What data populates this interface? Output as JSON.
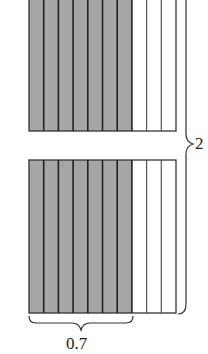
{
  "diagram": {
    "type": "fraction-model",
    "rectangles": [
      {
        "name": "top",
        "columns": 10,
        "shaded": 7,
        "y_top": -5,
        "y_bottom": 131
      },
      {
        "name": "bottom",
        "columns": 10,
        "shaded": 7,
        "y_top": 160,
        "y_bottom": 313
      }
    ],
    "x_left": 29,
    "x_right": 176,
    "colors": {
      "shade": "#a6a6a6",
      "line": "#333333",
      "background": "#ffffff"
    },
    "labels": {
      "total": "2",
      "shaded_part": "0.7"
    }
  }
}
